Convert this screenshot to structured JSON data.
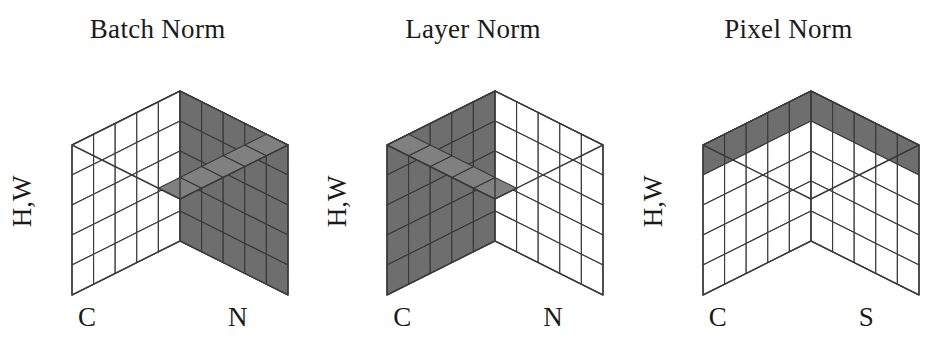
{
  "figure": {
    "caption": "",
    "panel_count": 3
  },
  "palette": {
    "shaded_fill": "#808080",
    "shaded_fill_dark": "#6e6e6e",
    "unshaded_fill": "#ffffff",
    "stroke": "#3a3a3a",
    "text": "#1a1a1a",
    "background": "#ffffff"
  },
  "panels": [
    {
      "id": "batch-norm",
      "title": "Batch Norm",
      "axis_vertical": "H,W",
      "axis_left": "C",
      "axis_right": "N",
      "grid": {
        "nx": 5,
        "ny": 5,
        "nz": 5
      },
      "highlight": "right-face",
      "highlight_description": "Entire right (N) face shaded plus the matching strip on the top face"
    },
    {
      "id": "layer-norm",
      "title": "Layer Norm",
      "axis_vertical": "H,W",
      "axis_left": "C",
      "axis_right": "N",
      "grid": {
        "nx": 5,
        "ny": 5,
        "nz": 5
      },
      "highlight": "left-face",
      "highlight_description": "Entire left (C) face shaded plus the matching strip on the top face"
    },
    {
      "id": "pixel-norm",
      "title": "Pixel Norm",
      "axis_vertical": "H,W",
      "axis_left": "C",
      "axis_right": "S",
      "grid": {
        "nx": 5,
        "ny": 5,
        "nz": 5
      },
      "highlight": "top-layer",
      "highlight_description": "Entire top face shaded plus the top row of both visible side faces"
    }
  ],
  "chart_data": {
    "type": "diagram",
    "subtype": "isometric-voxel-cubes",
    "axes": {
      "vertical": "H,W",
      "left": "C",
      "right_by_panel": [
        "N",
        "N",
        "S"
      ]
    },
    "cube_dimensions": [
      5,
      5,
      5
    ],
    "series": [
      {
        "name": "Batch Norm",
        "normalized_axes": [
          "N",
          "H",
          "W"
        ],
        "highlighted_region": "right-face",
        "highlighted_voxel_count": 25
      },
      {
        "name": "Layer Norm",
        "normalized_axes": [
          "C",
          "H",
          "W"
        ],
        "highlighted_region": "left-face",
        "highlighted_voxel_count": 25
      },
      {
        "name": "Pixel Norm",
        "normalized_axes": [
          "C",
          "S"
        ],
        "highlighted_region": "top-layer",
        "highlighted_voxel_count": 25
      }
    ],
    "legend": null,
    "grid": false
  }
}
